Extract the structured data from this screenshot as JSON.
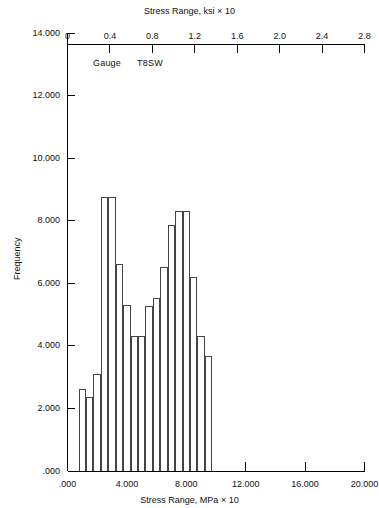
{
  "chart_data": {
    "type": "bar",
    "title": "",
    "xlabel": "Stress Range, MPa × 10",
    "ylabel": "Frequency",
    "top_xlabel": "Stress Range, ksi × 10",
    "annotation_label": "Gauge",
    "annotation_value": "T8SW",
    "xlim": [
      0,
      20
    ],
    "ylim": [
      0,
      14
    ],
    "top_xlim": [
      0,
      2.8
    ],
    "xticks": [
      ".000",
      "4.000",
      "8.000",
      "12.000",
      "16.000",
      "20.000"
    ],
    "xtick_values": [
      0,
      4,
      8,
      12,
      16,
      20
    ],
    "yticks": [
      ".000",
      "2.000",
      "4.000",
      "6.000",
      "8.000",
      "10.000",
      "12.000",
      "14.000"
    ],
    "ytick_values": [
      0,
      2,
      4,
      6,
      8,
      10,
      12,
      14
    ],
    "top_xticks": [
      "0",
      "0.4",
      "0.8",
      "1.2",
      "1.6",
      "2.0",
      "2.4",
      "2.8"
    ],
    "top_xtick_values": [
      0,
      0.4,
      0.8,
      1.2,
      1.6,
      2.0,
      2.4,
      2.8
    ],
    "grid": false,
    "legend": "none",
    "bin_width": 0.5,
    "bin_start": 0.25,
    "bin_edges": [
      0.25,
      0.75,
      1.25,
      1.75,
      2.25,
      2.75,
      3.25,
      3.75,
      4.25,
      4.75,
      5.25,
      5.75,
      6.25,
      6.75,
      7.25,
      7.75,
      8.25,
      8.75,
      9.25,
      9.75,
      10.25,
      10.75,
      11.25,
      11.75,
      12.25
    ],
    "categories": [
      0.5,
      1.0,
      1.5,
      2.0,
      2.5,
      3.0,
      3.5,
      4.0,
      4.5,
      5.0,
      5.5,
      6.0,
      6.5,
      7.0,
      7.5,
      8.0,
      8.5,
      9.0,
      9.5,
      10.0,
      10.5,
      11.0,
      11.5,
      12.0
    ],
    "values": [
      0.0,
      2.6,
      2.35,
      3.1,
      8.75,
      8.75,
      6.6,
      5.3,
      4.3,
      4.3,
      5.25,
      5.5,
      6.5,
      7.85,
      8.3,
      8.3,
      6.2,
      4.3,
      3.65,
      0.0,
      0.0,
      0.0,
      0.0,
      0.0
    ]
  }
}
